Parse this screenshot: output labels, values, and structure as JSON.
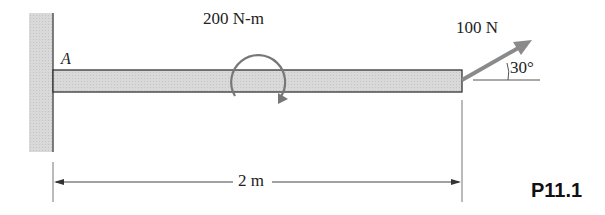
{
  "figure": {
    "id": "P11.1",
    "point_label": "A",
    "moment_label": "200 N-m",
    "force_label": "100 N",
    "angle_label": "30°",
    "length_label": "2 m"
  },
  "colors": {
    "beam_fill": "#d6d6d6",
    "wall_fill": "#dcdcdc",
    "line": "#444444",
    "arrow": "#888888"
  }
}
